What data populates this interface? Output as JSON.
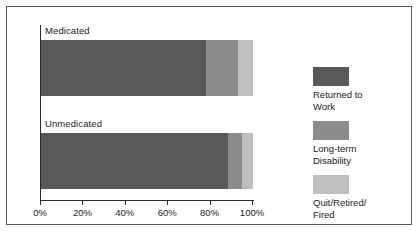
{
  "chart_data": {
    "type": "bar",
    "orientation": "horizontal",
    "stacked": true,
    "title": "",
    "xlabel": "",
    "ylabel": "",
    "categories": [
      "Medicated",
      "Unmedicated"
    ],
    "series": [
      {
        "name": "Returned to\nWork",
        "values": [
          78,
          88
        ],
        "color": "#595959"
      },
      {
        "name": "Long-term\nDisability",
        "values": [
          15,
          7
        ],
        "color": "#8c8c8c"
      },
      {
        "name": "Quit/Retired/\nFired",
        "values": [
          7,
          5
        ],
        "color": "#bfbfbf"
      }
    ],
    "xlim": [
      0,
      100
    ],
    "xticks": [
      0,
      20,
      40,
      60,
      80,
      100
    ],
    "xtick_labels": [
      "0%",
      "20%",
      "40%",
      "60%",
      "80%",
      "100%"
    ],
    "grid": false,
    "legend_position": "right",
    "border_color": "#5a5a5a",
    "axis_color": "#2b2b2b",
    "background": "#ffffff"
  }
}
